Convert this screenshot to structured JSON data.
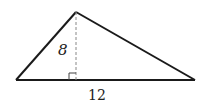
{
  "diagram": {
    "type": "triangle",
    "vertices": {
      "left": [
        16,
        80
      ],
      "apex": [
        76,
        12
      ],
      "right": [
        195,
        80
      ]
    },
    "height_label": "8",
    "base_label": "12",
    "height_line_style": "dashed",
    "right_angle_marker": true,
    "colors": {
      "stroke": "#1a1a1a",
      "dashed": "#888888",
      "text": "#222222"
    }
  }
}
